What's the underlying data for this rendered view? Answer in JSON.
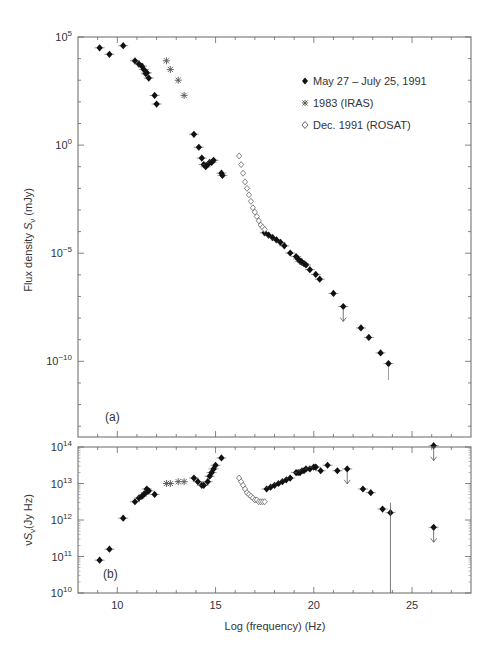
{
  "chart_data": [
    {
      "panel": "a",
      "type": "scatter",
      "panel_label": "(a)",
      "xlabel": "",
      "ylabel": "Flux density S_ν (mJy)",
      "yscale": "log",
      "xlim": [
        8,
        28
      ],
      "ylim_log10": [
        -13.5,
        5
      ],
      "ytick_labels": [
        "10^5",
        "10^0",
        "10^-5",
        "10^-10"
      ],
      "ytick_values_log10": [
        5,
        0,
        -5,
        -10
      ],
      "legend": [
        {
          "marker": "filled-diamond",
          "label": "May 27 – July 25, 1991"
        },
        {
          "marker": "asterisk",
          "label": "1983 (IRAS)"
        },
        {
          "marker": "open-diamond",
          "label": "Dec. 1991 (ROSAT)"
        }
      ],
      "series": [
        {
          "name": "May 27 – July 25, 1991",
          "marker": "filled-diamond",
          "x": [
            9.1,
            9.6,
            10.3,
            10.9,
            11.1,
            11.25,
            11.35,
            11.45,
            11.5,
            11.6,
            11.9,
            12.0,
            13.9,
            14.15,
            14.3,
            14.4,
            14.5,
            14.6,
            14.7,
            14.8,
            14.9,
            15.3,
            15.35,
            17.5,
            17.7,
            17.9,
            18.1,
            18.3,
            18.5,
            18.8,
            19.1,
            19.2,
            19.3,
            19.35,
            19.4,
            19.5,
            19.6,
            19.8,
            20.1,
            20.3,
            21.0,
            21.5,
            22.4,
            22.8,
            23.4,
            23.8,
            26.1
          ],
          "y_log10": [
            4.5,
            4.2,
            4.6,
            3.9,
            3.75,
            3.65,
            3.5,
            3.3,
            3.35,
            3.1,
            2.3,
            1.9,
            0.5,
            -0.1,
            -0.6,
            -0.9,
            -1.0,
            -0.9,
            -0.8,
            -0.8,
            -0.7,
            -1.3,
            -1.4,
            -4.1,
            -4.3,
            -4.5,
            -4.7,
            -4.9,
            -5.2,
            -5.8,
            -6.1,
            -6.3,
            -6.5,
            -6.5,
            -6.6,
            -6.7,
            -6.8,
            -7.2,
            -7.6,
            -8.0,
            -9.2,
            -10.3,
            -12.1,
            -12.9,
            -14.2,
            -15.1,
            -22.0
          ],
          "upper_limits_x": [
            21.5,
            26.1
          ]
        },
        {
          "name": "1983 (IRAS)",
          "marker": "asterisk",
          "x": [
            12.5,
            12.7,
            13.1,
            13.4
          ],
          "y_log10": [
            3.9,
            3.5,
            3.0,
            2.3
          ]
        },
        {
          "name": "Dec. 1991 (ROSAT)",
          "marker": "open-diamond",
          "x": [
            16.2,
            16.3,
            16.4,
            16.5,
            16.6,
            16.7,
            16.8,
            16.9,
            17.0,
            17.1,
            17.2,
            17.3,
            17.4,
            17.5
          ],
          "y_log10": [
            -0.5,
            -0.9,
            -1.3,
            -1.7,
            -2.0,
            -2.3,
            -2.6,
            -2.9,
            -3.1,
            -3.3,
            -3.5,
            -3.7,
            -3.8,
            -3.9
          ]
        }
      ]
    },
    {
      "panel": "b",
      "type": "scatter",
      "panel_label": "(b)",
      "xlabel": "Log (frequency) (Hz)",
      "ylabel": "νS_ν (Jy Hz)",
      "yscale": "log",
      "xlim": [
        8,
        28
      ],
      "ylim_log10": [
        10,
        14
      ],
      "xtick_labels": [
        "10",
        "15",
        "20",
        "25"
      ],
      "ytick_labels": [
        "10^14",
        "10^13",
        "10^12",
        "10^11",
        "10^10"
      ],
      "ytick_values_log10": [
        14,
        13,
        12,
        11,
        10
      ],
      "series": [
        {
          "name": "May 27 – July 25, 1991",
          "marker": "filled-diamond",
          "x": [
            9.1,
            9.6,
            10.3,
            10.9,
            11.1,
            11.25,
            11.35,
            11.45,
            11.5,
            11.6,
            11.9,
            13.9,
            14.1,
            14.3,
            14.4,
            14.6,
            14.7,
            14.8,
            14.9,
            15.0,
            15.3,
            17.6,
            17.8,
            18.0,
            18.2,
            18.4,
            18.6,
            18.8,
            19.1,
            19.2,
            19.3,
            19.4,
            19.5,
            19.6,
            19.8,
            20.0,
            20.1,
            20.35,
            20.7,
            21.2,
            21.7,
            22.5,
            22.9,
            23.5,
            23.9,
            26.1
          ],
          "y_log10": [
            10.9,
            11.2,
            12.05,
            12.5,
            12.6,
            12.65,
            12.7,
            12.75,
            12.85,
            12.8,
            12.7,
            13.15,
            13.05,
            12.95,
            12.95,
            13.05,
            13.2,
            13.3,
            13.4,
            13.5,
            13.7,
            12.85,
            12.9,
            12.95,
            13.0,
            13.05,
            13.1,
            13.15,
            13.3,
            13.3,
            13.3,
            13.35,
            13.35,
            13.4,
            13.4,
            13.45,
            13.45,
            13.35,
            13.5,
            13.35,
            13.4,
            12.85,
            12.75,
            12.3,
            12.2,
            11.8
          ],
          "upper_limits_x": [
            21.7,
            26.1
          ]
        },
        {
          "name": "1983 (IRAS)",
          "marker": "asterisk",
          "x": [
            12.5,
            12.7,
            13.1,
            13.4
          ],
          "y_log10": [
            13.0,
            13.0,
            13.05,
            13.05
          ]
        },
        {
          "name": "Dec. 1991 (ROSAT)",
          "marker": "open-diamond",
          "x": [
            16.2,
            16.3,
            16.4,
            16.5,
            16.6,
            16.7,
            16.8,
            16.9,
            17.0,
            17.1,
            17.2,
            17.3,
            17.4,
            17.5
          ],
          "y_log10": [
            13.15,
            13.05,
            12.95,
            12.85,
            12.75,
            12.7,
            12.65,
            12.6,
            12.55,
            12.55,
            12.5,
            12.5,
            12.5,
            12.5
          ]
        }
      ]
    }
  ],
  "labels": {
    "panel_a": "(a)",
    "panel_b": "(b)",
    "ylabel_a_prefix": "Flux density ",
    "ylabel_a_sym": "S",
    "ylabel_a_sub": "ν",
    "ylabel_a_unit": " (mJy)",
    "ylabel_b_prefix": "ν",
    "ylabel_b_sym": "S",
    "ylabel_b_sub": "ν",
    "ylabel_b_unit": "(Jy Hz)",
    "xlabel": "Log (frequency) (Hz)",
    "legend": [
      "May 27 – July 25, 1991",
      "1983 (IRAS)",
      "Dec. 1991 (ROSAT)"
    ],
    "xticks": [
      "10",
      "15",
      "20",
      "25"
    ],
    "ya_ticks": [
      {
        "base": "10",
        "exp": "5"
      },
      {
        "base": "10",
        "exp": "0"
      },
      {
        "base": "10",
        "exp": "−5"
      },
      {
        "base": "10",
        "exp": "−10"
      }
    ],
    "yb_ticks": [
      {
        "base": "10",
        "exp": "14"
      },
      {
        "base": "10",
        "exp": "13"
      },
      {
        "base": "10",
        "exp": "12"
      },
      {
        "base": "10",
        "exp": "11"
      },
      {
        "base": "10",
        "exp": "10"
      }
    ]
  }
}
